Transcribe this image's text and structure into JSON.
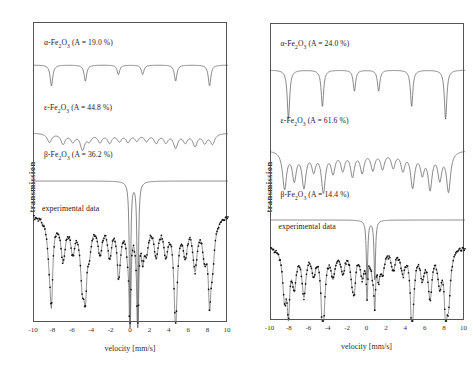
{
  "figure": {
    "panels": [
      {
        "id": "left",
        "yaxis_label": "transmission",
        "xaxis_label": "velocity [mm/s]",
        "xticks": [
          "-10",
          "-8",
          "-6",
          "-4",
          "-2",
          "0",
          "2",
          "4",
          "6",
          "8",
          "10"
        ],
        "xlim": [
          -10,
          10
        ],
        "components": [
          {
            "name": "alpha-Fe2O3",
            "prefix": "α-Fe",
            "sub1": "2",
            "mid": "O",
            "sub2": "3",
            "area_text": "(A = 19.0 %)",
            "area": 19.0
          },
          {
            "name": "epsilon-Fe2O3",
            "prefix": "ε-Fe",
            "sub1": "2",
            "mid": "O",
            "sub2": "3",
            "area_text": "(A = 44.8 %)",
            "area": 44.8
          },
          {
            "name": "beta-Fe2O3",
            "prefix": "β-Fe",
            "sub1": "2",
            "mid": "O",
            "sub2": "3",
            "area_text": "(A = 36.2 %)",
            "area": 36.2
          }
        ],
        "experimental_label": "experimental data"
      },
      {
        "id": "right",
        "yaxis_label": "transmission",
        "xaxis_label": "velocity [mm/s]",
        "xticks": [
          "-10",
          "-8",
          "-6",
          "-4",
          "-2",
          "0",
          "2",
          "4",
          "6",
          "8",
          "10"
        ],
        "xlim": [
          -10,
          10
        ],
        "components": [
          {
            "name": "alpha-Fe2O3",
            "prefix": "α-Fe",
            "sub1": "2",
            "mid": "O",
            "sub2": "3",
            "area_text": "(A = 24.0 %)",
            "area": 24.0
          },
          {
            "name": "epsilon-Fe2O3",
            "prefix": "ε-Fe",
            "sub1": "2",
            "mid": "O",
            "sub2": "3",
            "area_text": "(A = 61.6 %)",
            "area": 61.6
          },
          {
            "name": "beta-Fe2O3",
            "prefix": "β-Fe",
            "sub1": "2",
            "mid": "O",
            "sub2": "3",
            "area_text": "(A = 14.4 %)",
            "area": 14.4
          }
        ],
        "experimental_label": "experimental data"
      }
    ]
  },
  "chart_data": {
    "type": "line",
    "title": "",
    "xlabel": "velocity [mm/s]",
    "ylabel": "transmission",
    "xlim": [
      -10,
      10
    ],
    "grid": false,
    "legend": "none",
    "panels": [
      {
        "panel": "left",
        "subspectra": [
          {
            "name": "α-Fe2O3",
            "type": "sextet",
            "area_percent": 19.0,
            "line_positions": [
              -8.2,
              -4.7,
              -1.3,
              1.2,
              4.6,
              8.1
            ],
            "line_depths": [
              0.55,
              0.42,
              0.25,
              0.25,
              0.42,
              0.55
            ],
            "linewidth": 0.32
          },
          {
            "name": "ε-Fe2O3",
            "type": "multi-sextet",
            "area_percent": 44.8,
            "line_positions": [
              -8.4,
              -7.0,
              -6.0,
              -5.0,
              -4.3,
              -3.2,
              -2.2,
              -1.2,
              -0.3,
              0.6,
              1.6,
              2.6,
              3.6,
              4.6,
              5.6,
              6.6,
              7.6,
              8.4
            ],
            "line_depths": [
              0.3,
              0.34,
              0.26,
              0.52,
              0.22,
              0.28,
              0.3,
              0.24,
              0.26,
              0.22,
              0.24,
              0.3,
              0.28,
              0.46,
              0.28,
              0.4,
              0.3,
              0.34
            ],
            "linewidth": 0.55
          },
          {
            "name": "β-Fe2O3",
            "type": "doublet",
            "area_percent": 36.2,
            "line_positions": [
              -0.1,
              0.7
            ],
            "line_depths": [
              1.0,
              1.0
            ],
            "linewidth": 0.16
          }
        ],
        "experimental": {
          "label": "experimental data",
          "description": "Measured Mössbauer transmission spectrum with fitted envelope; broad sextet absorption across ±10 mm/s plus very deep narrow central doublet near 0 mm/s.",
          "central_doublet_positions": [
            -0.1,
            0.7
          ],
          "central_doublet_relative_depth": 1.0
        }
      },
      {
        "panel": "right",
        "subspectra": [
          {
            "name": "α-Fe2O3",
            "type": "sextet",
            "area_percent": 24.0,
            "line_positions": [
              -8.2,
              -4.7,
              -1.4,
              1.1,
              4.5,
              8.0
            ],
            "line_depths": [
              0.7,
              0.52,
              0.3,
              0.3,
              0.52,
              0.7
            ],
            "linewidth": 0.3
          },
          {
            "name": "ε-Fe2O3",
            "type": "multi-sextet",
            "area_percent": 61.6,
            "line_positions": [
              -8.6,
              -7.6,
              -6.6,
              -5.6,
              -4.6,
              -3.6,
              -2.6,
              -1.6,
              -0.6,
              0.5,
              1.5,
              2.6,
              3.6,
              4.6,
              5.6,
              6.4,
              7.4,
              8.3
            ],
            "line_depths": [
              0.62,
              0.46,
              0.58,
              0.3,
              0.66,
              0.34,
              0.3,
              0.4,
              0.34,
              0.3,
              0.28,
              0.26,
              0.3,
              0.58,
              0.34,
              0.6,
              0.44,
              0.66
            ],
            "linewidth": 0.5
          },
          {
            "name": "β-Fe2O3",
            "type": "doublet",
            "area_percent": 14.4,
            "line_positions": [
              -0.1,
              0.7
            ],
            "line_depths": [
              0.55,
              0.55
            ],
            "linewidth": 0.18
          }
        ],
        "experimental": {
          "label": "experimental data",
          "description": "Measured Mössbauer transmission spectrum with fitted envelope; strong multi-line absorption over the full ±10 mm/s range with moderate central doublet.",
          "central_doublet_positions": [
            -0.1,
            0.7
          ],
          "central_doublet_relative_depth": 0.55
        }
      }
    ]
  }
}
